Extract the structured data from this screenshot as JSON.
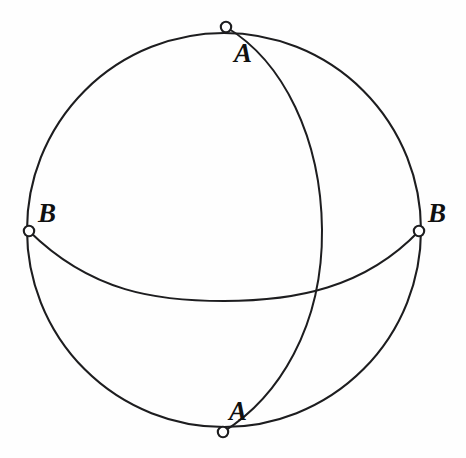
{
  "figure": {
    "background_color": "#fefefe",
    "stroke_color": "#1d1d1f",
    "marker_fill_color": "#ffffff",
    "label_color": "#101010"
  },
  "sphere": {
    "name": "sphere-outline",
    "center_x": 224,
    "center_y": 230,
    "radius": 197,
    "stroke_width": 2.1
  },
  "great_circles": [
    {
      "name": "equator-ellipse",
      "kind": "equator",
      "left_x": 29,
      "left_y": 231,
      "right_x": 419,
      "right_y": 231,
      "sag_y": 301,
      "stroke_width": 2.0
    },
    {
      "name": "meridian-ellipse",
      "kind": "meridian",
      "top_x": 226,
      "top_y": 27,
      "bottom_x": 223,
      "bottom_y": 432,
      "bulge_x": 322,
      "stroke_width": 2.0
    }
  ],
  "points": [
    {
      "id": "a-top",
      "label": "A",
      "cx": 226,
      "cy": 27,
      "r": 5.2,
      "label_x": 243,
      "label_y": 62
    },
    {
      "id": "a-bottom",
      "label": "A",
      "cx": 223,
      "cy": 432,
      "r": 5.2,
      "label_x": 238,
      "label_y": 420
    },
    {
      "id": "b-left",
      "label": "B",
      "cx": 29,
      "cy": 231,
      "r": 5.2,
      "label_x": 47,
      "label_y": 222
    },
    {
      "id": "b-right",
      "label": "B",
      "cx": 419,
      "cy": 231,
      "r": 5.2,
      "label_x": 437,
      "label_y": 222
    }
  ],
  "chart_data": {
    "type": "diagram",
    "labels": [
      "A",
      "B",
      "B",
      "A"
    ],
    "point_count": 4,
    "curve_count": 3
  }
}
